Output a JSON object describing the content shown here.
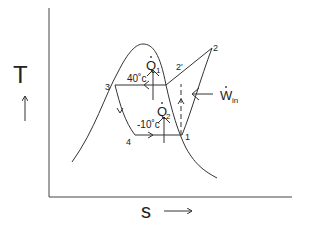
{
  "diagram": {
    "axes": {
      "y_label": "T",
      "x_label": "s"
    },
    "states": {
      "p1": "1",
      "p2": "2",
      "p2prime": "2'",
      "p3": "3",
      "p4": "4"
    },
    "temperatures": {
      "condenser": "40˚c",
      "evaporator": "-10˚c"
    },
    "heat_flows": {
      "q1_main": "Q",
      "q1_sub": "1",
      "q2_main": "Q",
      "q2_sub": "2"
    },
    "work": {
      "main": "W",
      "sub": "in"
    },
    "colors": {
      "line": "#333333",
      "background": "#ffffff"
    }
  }
}
